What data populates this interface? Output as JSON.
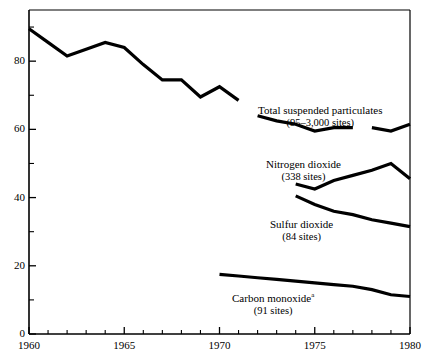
{
  "chart_data": {
    "type": "line",
    "title": "",
    "subtitle": "",
    "xlabel": "",
    "ylabel": "",
    "xlim": [
      1960,
      1980
    ],
    "ylim": [
      0,
      95
    ],
    "grid": false,
    "legend_position": "inline-annotations",
    "x_tick_labels": [
      "1960",
      "1965",
      "1970",
      "1975",
      "1980"
    ],
    "x_tick_values": [
      1960,
      1965,
      1970,
      1975,
      1980
    ],
    "x_minor_tick_values": [
      1961,
      1962,
      1963,
      1964,
      1966,
      1967,
      1968,
      1969,
      1971,
      1972,
      1973,
      1974,
      1976,
      1977,
      1978,
      1979
    ],
    "y_tick_labels": [
      "0",
      "20",
      "40",
      "60",
      "80"
    ],
    "y_tick_values": [
      0,
      20,
      40,
      60,
      80
    ],
    "y_minor_tick_values": [
      10,
      30,
      50,
      70,
      90
    ],
    "series": [
      {
        "name": "unlabeled-primary",
        "label": "",
        "sub_label": "",
        "x": [
          1960,
          1961,
          1962,
          1963,
          1964,
          1965,
          1966,
          1967,
          1968,
          1969,
          1970,
          1971
        ],
        "values": [
          89.5,
          85.5,
          81.5,
          83.5,
          85.5,
          84.0,
          79.0,
          74.5,
          74.5,
          69.5,
          72.5,
          68.5
        ]
      },
      {
        "name": "total-suspended-particulates",
        "label": "Total suspended particulates",
        "sub_label": "(95–3,000 sites)",
        "x": [
          1972,
          1973,
          1974,
          1975,
          1976,
          1977,
          1978,
          1979,
          1980
        ],
        "values": [
          64.0,
          62.5,
          61.5,
          59.5,
          60.5,
          60.5,
          60.5,
          59.5,
          61.5
        ],
        "gap_between": [
          1977,
          1978
        ]
      },
      {
        "name": "nitrogen-dioxide",
        "label": "Nitrogen dioxide",
        "sub_label": "(338 sites)",
        "x": [
          1974,
          1975,
          1976,
          1977,
          1978,
          1979,
          1980
        ],
        "values": [
          44.0,
          42.5,
          45.0,
          46.5,
          48.0,
          50.0,
          45.5
        ]
      },
      {
        "name": "sulfur-dioxide",
        "label": "Sulfur dioxide",
        "sub_label": "(84 sites)",
        "x": [
          1974,
          1975,
          1976,
          1977,
          1978,
          1979,
          1980
        ],
        "values": [
          40.5,
          38.0,
          36.0,
          35.0,
          33.5,
          32.5,
          31.5
        ]
      },
      {
        "name": "carbon-monoxide",
        "label": "Carbon monoxide",
        "label_superscript": "a",
        "sub_label": "(91 sites)",
        "x": [
          1970,
          1971,
          1972,
          1973,
          1974,
          1975,
          1976,
          1977,
          1978,
          1979,
          1980
        ],
        "values": [
          17.5,
          17.0,
          16.5,
          16.0,
          15.5,
          15.0,
          14.5,
          14.0,
          13.0,
          11.5,
          11.0
        ]
      }
    ],
    "colors": {
      "line": "#000000",
      "axis": "#000000",
      "background": "#ffffff",
      "text": "#000000"
    }
  }
}
